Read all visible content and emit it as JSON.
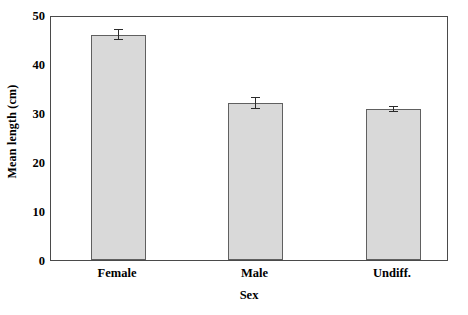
{
  "chart_data": {
    "type": "bar",
    "title": "",
    "subtitle": "",
    "xlabel": "Sex",
    "ylabel": "Mean length (cm)",
    "categories": [
      "Female",
      "Male",
      "Undiff."
    ],
    "values": [
      46.0,
      32.0,
      30.8
    ],
    "errors": [
      1.2,
      1.2,
      0.6
    ],
    "error_type": "symmetric",
    "ylim": [
      0,
      50
    ],
    "yticks": [
      0,
      10,
      20,
      30,
      40,
      50
    ],
    "ytick_labels": [
      "0",
      "10",
      "20",
      "30",
      "40",
      "50"
    ],
    "grid": false,
    "legend": null,
    "annotations": [],
    "series": [
      {
        "name": "Mean length",
        "values": [
          46.0,
          32.0,
          30.8
        ],
        "errors": [
          1.2,
          1.2,
          0.6
        ]
      }
    ],
    "style": {
      "bar_fill": "#d9d9d9",
      "bar_edge": "#606060",
      "frame_color": "#4a4a4a",
      "error_color": "#2b2b2b",
      "background": "#ffffff"
    }
  }
}
